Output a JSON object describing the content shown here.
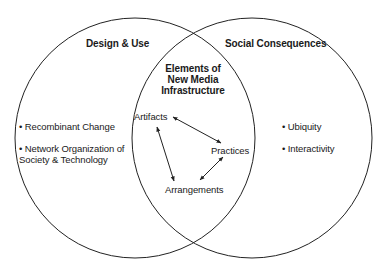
{
  "diagram": {
    "type": "venn",
    "circles": [
      {
        "id": "left",
        "label": "Design & Use",
        "cx": 135,
        "cy": 138,
        "r": 120
      },
      {
        "id": "right",
        "label": "Social Consequences",
        "cx": 252,
        "cy": 138,
        "r": 120
      }
    ],
    "stroke_color": "#222222",
    "left": {
      "title": "Design & Use",
      "items": [
        {
          "label": "Recombinant Change"
        },
        {
          "label_line1": "Network Organization of",
          "label_line2": "Society & Technology"
        }
      ]
    },
    "right": {
      "title": "Social Consequences",
      "items": [
        {
          "label": "Ubiquity"
        },
        {
          "label": "Interactivity"
        }
      ]
    },
    "intersection": {
      "title_lines": [
        "Elements of",
        "New Media",
        "Infrastructure"
      ],
      "nodes": [
        {
          "id": "artifacts",
          "label": "Artifacts"
        },
        {
          "id": "practices",
          "label": "Practices"
        },
        {
          "id": "arrangements",
          "label": "Arrangements"
        }
      ],
      "edges": [
        {
          "from": "artifacts",
          "to": "practices",
          "type": "bidirectional"
        },
        {
          "from": "artifacts",
          "to": "arrangements",
          "type": "bidirectional"
        },
        {
          "from": "practices",
          "to": "arrangements",
          "type": "bidirectional"
        }
      ]
    }
  }
}
